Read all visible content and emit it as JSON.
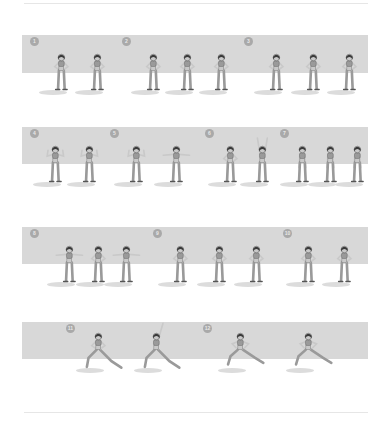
{
  "colors": {
    "band": "#d8d8d8",
    "badge": "#a9a9a9",
    "skin": "#c9c9c9",
    "outfit": "#9a9a9a",
    "hair": "#3a3a3a",
    "outline": "#555555"
  },
  "rows": [
    {
      "band_top": 35,
      "band_height": 38,
      "steps": [
        {
          "number": "1",
          "badge_x": 30,
          "figures": [
            {
              "x": 53,
              "pose": "stand"
            },
            {
              "x": 89,
              "pose": "stand"
            }
          ]
        },
        {
          "number": "2",
          "badge_x": 122,
          "figures": [
            {
              "x": 145,
              "pose": "tilt-left"
            },
            {
              "x": 179,
              "pose": "stand"
            },
            {
              "x": 213,
              "pose": "tilt-right"
            }
          ]
        },
        {
          "number": "3",
          "badge_x": 244,
          "figures": [
            {
              "x": 268,
              "pose": "rotate"
            },
            {
              "x": 305,
              "pose": "stand"
            },
            {
              "x": 341,
              "pose": "rotate"
            }
          ]
        }
      ]
    },
    {
      "band_top": 127,
      "band_height": 37,
      "steps": [
        {
          "number": "4",
          "badge_x": 30,
          "figures": [
            {
              "x": 47,
              "pose": "shoulders"
            },
            {
              "x": 81,
              "pose": "shoulders"
            }
          ]
        },
        {
          "number": "5",
          "badge_x": 110,
          "figures": [
            {
              "x": 128,
              "pose": "flex"
            },
            {
              "x": 168,
              "pose": "arms-out"
            }
          ]
        },
        {
          "number": "6",
          "badge_x": 205,
          "figures": [
            {
              "x": 222,
              "pose": "stand"
            },
            {
              "x": 254,
              "pose": "arms-up"
            }
          ]
        },
        {
          "number": "7",
          "badge_x": 280,
          "figures": [
            {
              "x": 294,
              "pose": "knees"
            },
            {
              "x": 322,
              "pose": "knees"
            },
            {
              "x": 349,
              "pose": "knees"
            }
          ]
        }
      ]
    },
    {
      "band_top": 227,
      "band_height": 37,
      "steps": [
        {
          "number": "8",
          "badge_x": 30,
          "figures": [
            {
              "x": 61,
              "pose": "twist"
            },
            {
              "x": 90,
              "pose": "stand"
            },
            {
              "x": 118,
              "pose": "twist"
            }
          ]
        },
        {
          "number": "9",
          "badge_x": 153,
          "figures": [
            {
              "x": 172,
              "pose": "hips"
            },
            {
              "x": 211,
              "pose": "hips"
            },
            {
              "x": 248,
              "pose": "hips"
            }
          ]
        },
        {
          "number": "10",
          "badge_x": 283,
          "figures": [
            {
              "x": 300,
              "pose": "ankle"
            },
            {
              "x": 336,
              "pose": "ankle"
            }
          ]
        }
      ]
    },
    {
      "band_top": 322,
      "band_height": 37,
      "steps": [
        {
          "number": "11",
          "badge_x": 66,
          "figures": [
            {
              "x": 90,
              "pose": "lunge"
            },
            {
              "x": 148,
              "pose": "lunge-reach"
            }
          ]
        },
        {
          "number": "12",
          "badge_x": 203,
          "figures": [
            {
              "x": 232,
              "pose": "side-lunge"
            },
            {
              "x": 300,
              "pose": "side-lunge"
            }
          ]
        }
      ]
    }
  ]
}
